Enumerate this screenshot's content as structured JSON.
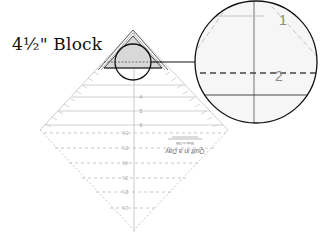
{
  "title": "4½\" Block",
  "ruler": {
    "solid_labels": [
      "4",
      "5",
      "6"
    ],
    "dashed_labels": [
      "5½",
      "5½",
      "4½",
      "3½",
      "2½",
      "1½"
    ],
    "brand_text": "Quilt in a Day",
    "fine_print": "Made in USA"
  },
  "magnifier": {
    "labels": [
      "1",
      "2"
    ]
  },
  "colors": {
    "ink": "#111111",
    "ruler_line": "#bdbdbd",
    "ruler_dash": "#b0b0b0",
    "triangle_fill": "#d8d8d8",
    "magnifier_fill": "#f6f6f6",
    "magnifier_label": "#8a8a8a"
  }
}
